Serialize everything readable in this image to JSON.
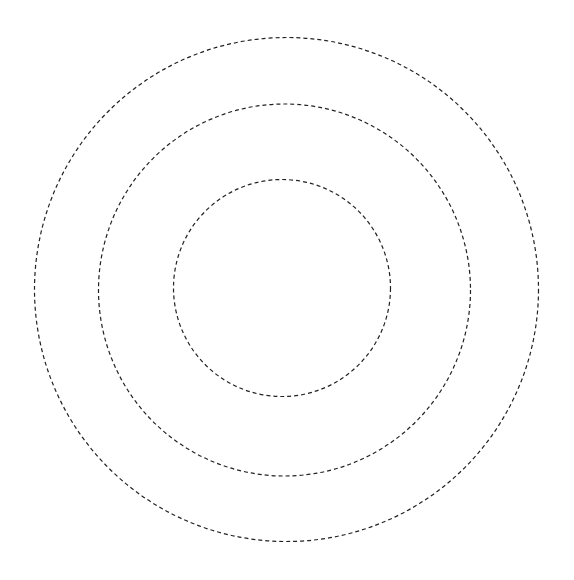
{
  "canvas": {
    "width": 574,
    "height": 580,
    "background": "#ffffff"
  },
  "style": {
    "stroke": "#222222",
    "stroke_width": 1.2,
    "dasharray": "4 3"
  },
  "circles": [
    {
      "name": "outer-circle",
      "cx": 286.5,
      "cy": 289.5,
      "r": 252
    },
    {
      "name": "middle-circle",
      "cx": 284.5,
      "cy": 290,
      "r": 186
    },
    {
      "name": "inner-circle",
      "cx": 282,
      "cy": 288,
      "r": 108.5
    }
  ]
}
